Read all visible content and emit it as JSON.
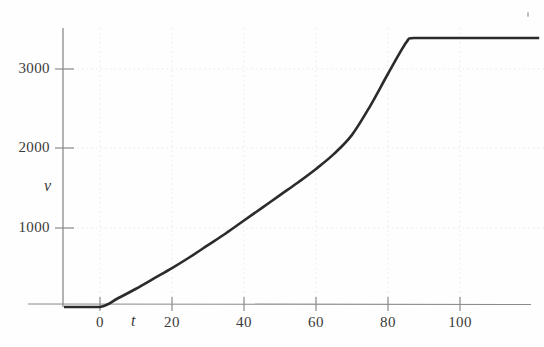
{
  "figure": {
    "kind": "scanned-textbook-graph",
    "background_color": "#fefefe",
    "curve_color": "#2b2b2b",
    "axis_color": "#8a8a8a",
    "grid_color": "#e8e8e8",
    "text_color": "#3a3a3a"
  },
  "chart_data": {
    "type": "line",
    "title": "",
    "xlabel": "t",
    "ylabel": "v",
    "xlim": [
      -10,
      122
    ],
    "ylim": [
      0,
      3850
    ],
    "grid": true,
    "grid_style": "dotted",
    "legend": null,
    "x_ticks": [
      0,
      20,
      40,
      60,
      80,
      100
    ],
    "x_tick_labels": [
      "0",
      "20",
      "40",
      "60",
      "80",
      "100"
    ],
    "y_ticks": [
      1000,
      2000,
      3000
    ],
    "y_tick_labels": [
      "1000",
      "2000",
      "3000"
    ],
    "series": [
      {
        "name": "v",
        "x": [
          -10,
          0,
          5,
          10,
          15,
          20,
          25,
          30,
          35,
          40,
          45,
          50,
          55,
          60,
          65,
          70,
          75,
          80,
          85,
          87,
          95,
          105,
          115,
          122
        ],
        "values": [
          0,
          0,
          110,
          230,
          360,
          490,
          630,
          780,
          930,
          1090,
          1250,
          1410,
          1570,
          1740,
          1930,
          2170,
          2530,
          2940,
          3330,
          3390,
          3390,
          3390,
          3390,
          3390
        ]
      }
    ],
    "annotations": [
      {
        "label": "plateau-corner",
        "x": 87,
        "y": 3390,
        "note": "curve reaches terminal value and becomes horizontal"
      }
    ]
  },
  "axis_labels": {
    "y_axis_name": "v",
    "x_axis_name": "t"
  }
}
